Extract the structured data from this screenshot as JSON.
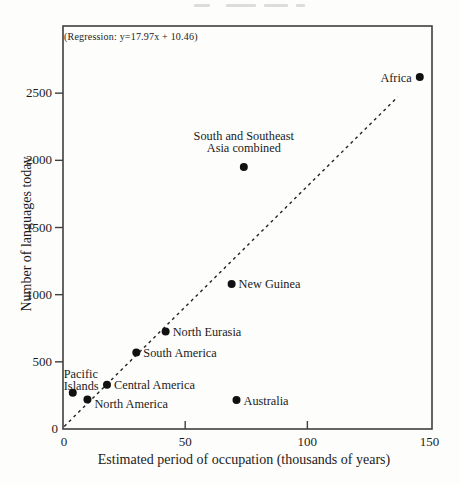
{
  "chart_data": {
    "type": "scatter",
    "title": "",
    "annotation": "(Regression:  y=17.97x + 10.46)",
    "xlabel": "Estimated period of occupation (thousands of years)",
    "ylabel": "Number of languages today",
    "xlim": [
      0,
      151
    ],
    "ylim": [
      0,
      3000
    ],
    "xticks": [
      0,
      50,
      100,
      150
    ],
    "yticks": [
      0,
      500,
      1000,
      1500,
      2000,
      2500
    ],
    "grid": false,
    "marker_color": "#111111",
    "ink_color": "#1b1b1b",
    "frame_color": "#3f3f3f",
    "regression_line": {
      "slope": 17.97,
      "intercept": 10.46,
      "style": "dashed",
      "x_start": 0.5,
      "x_end": 137
    },
    "points": [
      {
        "label": "Pacific Islands",
        "label_lines": [
          "Pacific",
          "Islands"
        ],
        "x": 4,
        "y": 270,
        "label_pos": "above-left"
      },
      {
        "label": "North America",
        "x": 10,
        "y": 220,
        "label_pos": "right-below"
      },
      {
        "label": "Central America",
        "x": 18,
        "y": 330,
        "label_pos": "right"
      },
      {
        "label": "South America",
        "x": 30,
        "y": 570,
        "label_pos": "right"
      },
      {
        "label": "North Eurasia",
        "x": 42,
        "y": 725,
        "label_pos": "right"
      },
      {
        "label": "New Guinea",
        "x": 69,
        "y": 1080,
        "label_pos": "right"
      },
      {
        "label": "Australia",
        "x": 71,
        "y": 215,
        "label_pos": "right"
      },
      {
        "label": "South and Southeast Asia combined",
        "label_lines": [
          "South and Southeast",
          "Asia combined"
        ],
        "x": 74,
        "y": 1950,
        "label_pos": "above"
      },
      {
        "label": "Africa",
        "x": 146,
        "y": 2620,
        "label_pos": "left"
      }
    ]
  }
}
